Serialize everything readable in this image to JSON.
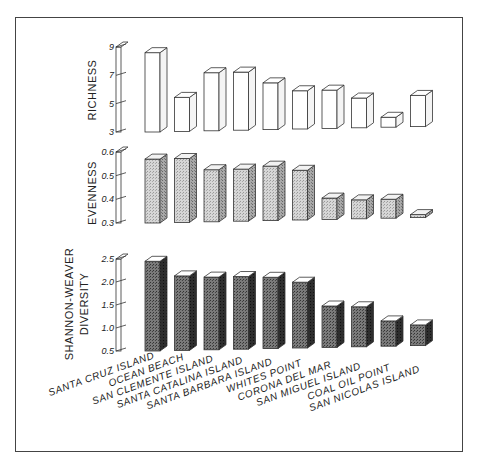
{
  "chart_data": [
    {
      "type": "bar",
      "title": "",
      "ylabel": "RICHNESS",
      "xlabel": "",
      "categories": [
        "SANTA CRUZ ISLAND",
        "OCEAN BEACH",
        "SAN CLEMENTE ISLAND",
        "SANTA CATALINA ISLAND",
        "SANTA BARBARA ISLAND",
        "WHITES POINT",
        "CORONA DEL MAR",
        "SAN MIGUEL ISLAND",
        "COAL OIL POINT",
        "SAN NICOLAS ISLAND"
      ],
      "values": [
        8.6,
        5.4,
        7.1,
        7.1,
        6.3,
        5.7,
        5.7,
        5.1,
        3.7,
        5.2
      ],
      "ylim": [
        3,
        9
      ],
      "yticks": [
        "3",
        "5",
        "7",
        "9"
      ],
      "bar_style": "white 3D",
      "grid": false
    },
    {
      "type": "bar",
      "title": "",
      "ylabel": "EVENNESS",
      "xlabel": "",
      "categories": [
        "SANTA CRUZ ISLAND",
        "OCEAN BEACH",
        "SAN CLEMENTE ISLAND",
        "SANTA CATALINA ISLAND",
        "SANTA BARBARA ISLAND",
        "WHITES POINT",
        "CORONA DEL MAR",
        "SAN MIGUEL ISLAND",
        "COAL OIL POINT",
        "SAN NICOLAS ISLAND"
      ],
      "values": [
        0.57,
        0.57,
        0.52,
        0.52,
        0.53,
        0.51,
        0.39,
        0.38,
        0.38,
        0.29
      ],
      "ylim": [
        0.3,
        0.6
      ],
      "yticks": [
        "0.3",
        "0.4",
        "0.5",
        "0.6"
      ],
      "bar_style": "light stippled 3D",
      "grid": false
    },
    {
      "type": "bar",
      "title": "",
      "ylabel": "SHANNON-WEAVER DIVERSITY",
      "xlabel": "",
      "categories": [
        "SANTA CRUZ ISLAND",
        "OCEAN BEACH",
        "SAN CLEMENTE ISLAND",
        "SANTA CATALINA ISLAND",
        "SANTA BARBARA ISLAND",
        "WHITES POINT",
        "CORONA DEL MAR",
        "SAN MIGUEL ISLAND",
        "COAL OIL POINT",
        "SAN NICOLAS ISLAND"
      ],
      "values": [
        2.45,
        2.12,
        2.08,
        2.08,
        2.05,
        1.93,
        1.4,
        1.37,
        1.05,
        0.95
      ],
      "ylim": [
        0.5,
        2.5
      ],
      "yticks": [
        "0.5",
        "1.0",
        "1.5",
        "2.0",
        "2.5"
      ],
      "bar_style": "dark stippled 3D",
      "grid": false
    }
  ],
  "panels": {
    "richness": {
      "label": "RICHNESS",
      "ticks": [
        "9",
        "7",
        "5",
        "3"
      ]
    },
    "evenness": {
      "label": "EVENNESS",
      "ticks": [
        "0.6",
        "0.5",
        "0.4",
        "0.3"
      ]
    },
    "diversity": {
      "label_line1": "SHANNON-WEAVER",
      "label_line2": "DIVERSITY",
      "ticks": [
        "2.5",
        "2.0",
        "1.5",
        "1.0",
        "0.5"
      ]
    }
  },
  "categories": [
    "SANTA CRUZ ISLAND",
    "OCEAN BEACH",
    "SAN CLEMENTE ISLAND",
    "SANTA CATALINA ISLAND",
    "SANTA BARBARA ISLAND",
    "WHITES POINT",
    "CORONA DEL MAR",
    "SAN MIGUEL ISLAND",
    "COAL OIL POINT",
    "SAN NICOLAS ISLAND"
  ],
  "colors": {
    "outline": "#333333",
    "richness_front": "#ffffff",
    "richness_side": "#f4f4f4",
    "evenness_front": "#cfcfcf",
    "evenness_side": "#9a9a9a",
    "diversity_front": "#6a6a6a",
    "diversity_side": "#2a2a2a"
  }
}
